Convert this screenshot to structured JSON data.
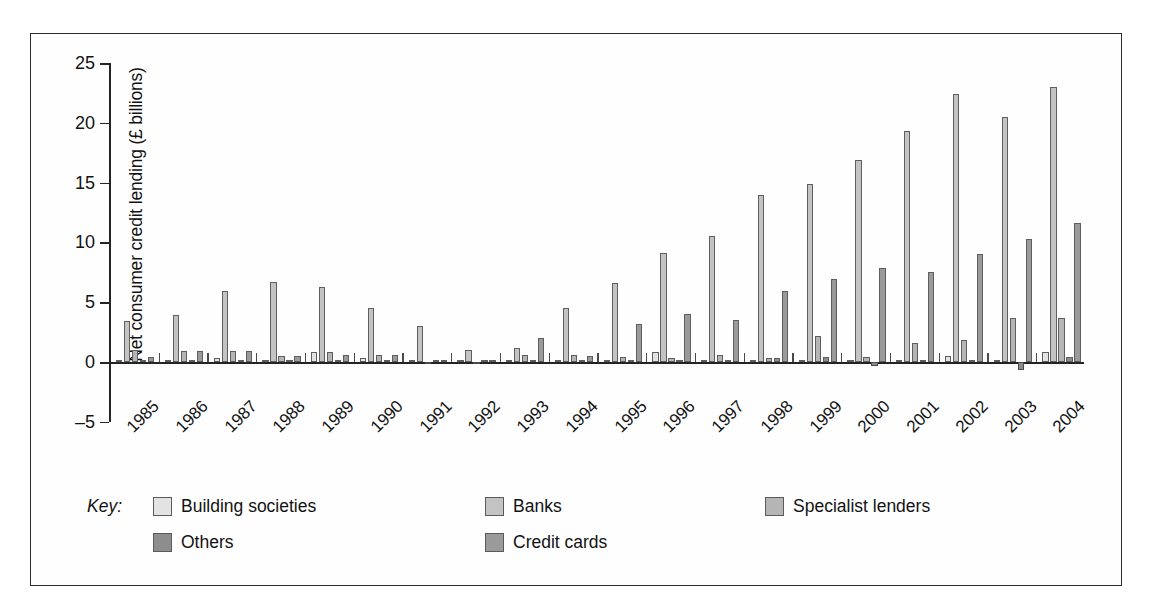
{
  "figure": {
    "y_axis_title": "Net consumer credit lending (£ billions)",
    "key_word": "Key:"
  },
  "legend": {
    "items": [
      {
        "label": "Building societies",
        "color": "#e3e3e3"
      },
      {
        "label": "Banks",
        "color": "#c3c3c3"
      },
      {
        "label": "Specialist lenders",
        "color": "#b5b5b5"
      },
      {
        "label": "Others",
        "color": "#8d8d8d"
      },
      {
        "label": "Credit cards",
        "color": "#9a9a9a"
      }
    ]
  },
  "chart_data": {
    "type": "bar",
    "title": "",
    "xlabel": "",
    "ylabel": "Net consumer credit lending (£ billions)",
    "ylim": [
      -5,
      25
    ],
    "yticks": [
      -5,
      0,
      5,
      10,
      15,
      20,
      25
    ],
    "grid": false,
    "legend_position": "bottom",
    "categories": [
      "1985",
      "1986",
      "1987",
      "1988",
      "1989",
      "1990",
      "1991",
      "1992",
      "1993",
      "1994",
      "1995",
      "1996",
      "1997",
      "1998",
      "1999",
      "2000",
      "2001",
      "2002",
      "2003",
      "2004"
    ],
    "series": [
      {
        "name": "Building societies",
        "color": "#e3e3e3",
        "values": [
          0.05,
          0.05,
          0.3,
          0.15,
          0.8,
          0.35,
          0.05,
          0.05,
          0.1,
          0.1,
          0.1,
          0.8,
          0.1,
          0.1,
          0.2,
          0.1,
          0.1,
          0.5,
          0.1,
          0.8
        ]
      },
      {
        "name": "Banks",
        "color": "#c3c3c3",
        "values": [
          3.4,
          3.9,
          5.9,
          6.7,
          6.3,
          4.5,
          3.0,
          1.0,
          1.2,
          4.5,
          6.6,
          9.1,
          10.5,
          14.0,
          14.9,
          16.9,
          19.3,
          22.4,
          20.5,
          23.0
        ]
      },
      {
        "name": "Specialist lenders",
        "color": "#b5b5b5",
        "values": [
          1.0,
          0.9,
          0.9,
          0.5,
          0.85,
          0.6,
          -0.15,
          -0.2,
          0.6,
          0.6,
          0.4,
          0.35,
          0.6,
          0.35,
          2.2,
          0.45,
          1.6,
          1.8,
          3.7,
          3.7
        ]
      },
      {
        "name": "Others",
        "color": "#8d8d8d",
        "values": [
          0.05,
          0.05,
          0.05,
          0.05,
          0.05,
          0.1,
          0.05,
          0.05,
          0.05,
          0.05,
          0.05,
          0.05,
          0.1,
          0.35,
          0.4,
          -0.3,
          0.1,
          0.15,
          -0.7,
          0.45
        ]
      },
      {
        "name": "Credit cards",
        "color": "#9a9a9a",
        "values": [
          0.45,
          0.9,
          0.9,
          0.5,
          0.6,
          0.6,
          0.1,
          0.1,
          2.0,
          0.5,
          3.2,
          4.0,
          3.5,
          5.9,
          6.9,
          7.9,
          7.5,
          9.0,
          10.3,
          11.6
        ]
      }
    ]
  }
}
